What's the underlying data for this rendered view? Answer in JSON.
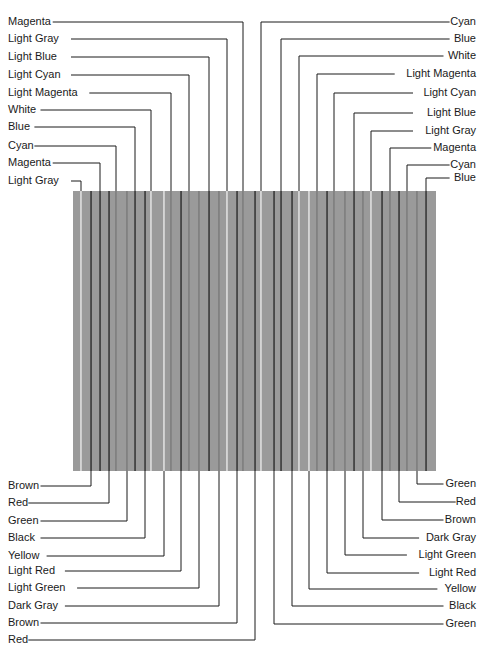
{
  "panel": {
    "x": 73,
    "y": 191,
    "width": 363,
    "height": 280,
    "fill": "#9a9a9a",
    "stripe_dark": "#3a3a3a",
    "stripe_mid": "#7a7a7a",
    "stripe_light": "#e8e8e8"
  },
  "stripes": [
    {
      "x": 81,
      "tone": "light"
    },
    {
      "x": 91,
      "tone": "dark"
    },
    {
      "x": 100,
      "tone": "dark"
    },
    {
      "x": 109,
      "tone": "dark"
    },
    {
      "x": 116,
      "tone": "mid"
    },
    {
      "x": 127,
      "tone": "mid"
    },
    {
      "x": 135,
      "tone": "dark"
    },
    {
      "x": 145,
      "tone": "dark"
    },
    {
      "x": 151,
      "tone": "light"
    },
    {
      "x": 164,
      "tone": "light"
    },
    {
      "x": 171,
      "tone": "mid"
    },
    {
      "x": 181,
      "tone": "dark"
    },
    {
      "x": 189,
      "tone": "mid"
    },
    {
      "x": 199,
      "tone": "mid"
    },
    {
      "x": 209,
      "tone": "dark"
    },
    {
      "x": 219,
      "tone": "mid"
    },
    {
      "x": 227,
      "tone": "light"
    },
    {
      "x": 237,
      "tone": "dark"
    },
    {
      "x": 243,
      "tone": "mid"
    },
    {
      "x": 255,
      "tone": "dark"
    },
    {
      "x": 261,
      "tone": "light"
    },
    {
      "x": 274,
      "tone": "dark"
    },
    {
      "x": 281,
      "tone": "dark"
    },
    {
      "x": 292,
      "tone": "dark"
    },
    {
      "x": 299,
      "tone": "light"
    },
    {
      "x": 309,
      "tone": "light"
    },
    {
      "x": 317,
      "tone": "mid"
    },
    {
      "x": 327,
      "tone": "dark"
    },
    {
      "x": 334,
      "tone": "mid"
    },
    {
      "x": 345,
      "tone": "mid"
    },
    {
      "x": 354,
      "tone": "dark"
    },
    {
      "x": 363,
      "tone": "mid"
    },
    {
      "x": 371,
      "tone": "light"
    },
    {
      "x": 382,
      "tone": "dark"
    },
    {
      "x": 390,
      "tone": "mid"
    },
    {
      "x": 399,
      "tone": "dark"
    },
    {
      "x": 407,
      "tone": "mid"
    },
    {
      "x": 417,
      "tone": "mid"
    },
    {
      "x": 426,
      "tone": "dark"
    }
  ],
  "top_left_labels": [
    {
      "text": "Magenta",
      "y": 22,
      "tx": 8,
      "lineX": 243
    },
    {
      "text": "Light Gray",
      "y": 39,
      "tx": 8,
      "lineX": 227
    },
    {
      "text": "Light Blue",
      "y": 57,
      "tx": 8,
      "lineX": 209
    },
    {
      "text": "Light Cyan",
      "y": 75,
      "tx": 8,
      "lineX": 189
    },
    {
      "text": "Light Magenta",
      "y": 93,
      "tx": 8,
      "lineX": 171
    },
    {
      "text": "White",
      "y": 110,
      "tx": 8,
      "lineX": 151
    },
    {
      "text": "Blue",
      "y": 127,
      "tx": 8,
      "lineX": 135
    },
    {
      "text": "Cyan",
      "y": 146,
      "tx": 8,
      "lineX": 116
    },
    {
      "text": "Magenta",
      "y": 163,
      "tx": 8,
      "lineX": 100
    },
    {
      "text": "Light Gray",
      "y": 181,
      "tx": 8,
      "lineX": 81
    }
  ],
  "top_right_labels": [
    {
      "text": "Cyan",
      "y": 22,
      "lineX": 261
    },
    {
      "text": "Blue",
      "y": 39,
      "lineX": 281
    },
    {
      "text": "White",
      "y": 56,
      "lineX": 299
    },
    {
      "text": "Light Magenta",
      "y": 74,
      "lineX": 317
    },
    {
      "text": "Light Cyan",
      "y": 93,
      "lineX": 334
    },
    {
      "text": "Light Blue",
      "y": 113,
      "lineX": 354
    },
    {
      "text": "Light Gray",
      "y": 131,
      "lineX": 371
    },
    {
      "text": "Magenta",
      "y": 148,
      "lineX": 390
    },
    {
      "text": "Cyan",
      "y": 165,
      "lineX": 407
    },
    {
      "text": "Blue",
      "y": 178,
      "lineX": 426
    }
  ],
  "bottom_left_labels": [
    {
      "text": "Brown",
      "y": 486,
      "lineX": 91
    },
    {
      "text": "Red",
      "y": 503,
      "lineX": 109
    },
    {
      "text": "Green",
      "y": 521,
      "lineX": 127
    },
    {
      "text": "Black",
      "y": 538,
      "lineX": 145
    },
    {
      "text": "Yellow",
      "y": 556,
      "lineX": 164
    },
    {
      "text": "Light Red",
      "y": 571,
      "lineX": 181
    },
    {
      "text": "Light Green",
      "y": 588,
      "lineX": 199
    },
    {
      "text": "Dark Gray",
      "y": 606,
      "lineX": 219
    },
    {
      "text": "Brown",
      "y": 623,
      "lineX": 237
    },
    {
      "text": "Red",
      "y": 640,
      "lineX": 255
    }
  ],
  "bottom_right_labels": [
    {
      "text": "Green",
      "y": 484,
      "lineX": 417
    },
    {
      "text": "Red",
      "y": 502,
      "lineX": 399
    },
    {
      "text": "Brown",
      "y": 520,
      "lineX": 382
    },
    {
      "text": "Dark Gray",
      "y": 538,
      "lineX": 363
    },
    {
      "text": "Light Green",
      "y": 555,
      "lineX": 345
    },
    {
      "text": "Light Red",
      "y": 573,
      "lineX": 327
    },
    {
      "text": "Yellow",
      "y": 589,
      "lineX": 309
    },
    {
      "text": "Black",
      "y": 606,
      "lineX": 292
    },
    {
      "text": "Green",
      "y": 624,
      "lineX": 274
    }
  ],
  "style": {
    "line_color": "#1a1a1a",
    "text_color": "#1a1a1a",
    "label_right_edge": 476
  }
}
